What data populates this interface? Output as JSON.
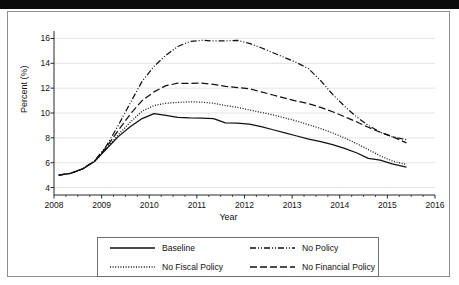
{
  "figure": {
    "outer_frame_color": "#8e8e8e",
    "scan_artifact": "black-bar-top"
  },
  "chart_data": {
    "type": "line",
    "title": "",
    "xlabel": "Year",
    "ylabel": "Percent (%)",
    "xlim": [
      2008,
      2016
    ],
    "ylim": [
      3.4,
      16.6
    ],
    "xticks": [
      2008,
      2009,
      2010,
      2011,
      2012,
      2013,
      2014,
      2015,
      2016
    ],
    "xtick_labels": [
      "2008",
      "2009",
      "2010",
      "2011",
      "2012",
      "2013",
      "2014",
      "2015",
      "2016"
    ],
    "yticks": [
      4,
      6,
      8,
      10,
      12,
      14,
      16
    ],
    "ytick_labels": [
      "4",
      "6",
      "8",
      "10",
      "12",
      "14",
      "16"
    ],
    "grid": "horizontal-major",
    "grid_color": "#d9d9d9",
    "legend_position": "below-axes",
    "line_color": "#111111",
    "series": [
      {
        "name": "Baseline",
        "style": "solid",
        "dash": "none",
        "x": [
          2008.1,
          2008.35,
          2008.6,
          2008.85,
          2009.1,
          2009.35,
          2009.6,
          2009.85,
          2010.1,
          2010.35,
          2010.6,
          2010.85,
          2011.1,
          2011.35,
          2011.6,
          2011.85,
          2012.1,
          2012.35,
          2012.6,
          2012.85,
          2013.1,
          2013.35,
          2013.6,
          2013.85,
          2014.1,
          2014.35,
          2014.6,
          2014.85,
          2015.1,
          2015.4
        ],
        "y": [
          5.0,
          5.15,
          5.5,
          6.1,
          7.1,
          8.1,
          8.9,
          9.55,
          9.95,
          9.8,
          9.65,
          9.6,
          9.58,
          9.55,
          9.2,
          9.18,
          9.1,
          8.9,
          8.65,
          8.4,
          8.15,
          7.9,
          7.7,
          7.45,
          7.15,
          6.8,
          6.35,
          6.2,
          5.9,
          5.65
        ]
      },
      {
        "name": "No Fiscal Policy",
        "style": "dotted",
        "dash": "1,1.6",
        "x": [
          2008.1,
          2008.35,
          2008.6,
          2008.85,
          2009.1,
          2009.35,
          2009.6,
          2009.85,
          2010.1,
          2010.35,
          2010.6,
          2010.85,
          2011.1,
          2011.35,
          2011.6,
          2011.85,
          2012.1,
          2012.35,
          2012.6,
          2012.85,
          2013.1,
          2013.35,
          2013.6,
          2013.85,
          2014.1,
          2014.35,
          2014.6,
          2014.85,
          2015.1,
          2015.4
        ],
        "y": [
          5.0,
          5.15,
          5.5,
          6.1,
          7.15,
          8.25,
          9.25,
          10.15,
          10.6,
          10.78,
          10.85,
          10.9,
          10.88,
          10.78,
          10.6,
          10.45,
          10.25,
          10.05,
          9.85,
          9.6,
          9.35,
          9.05,
          8.75,
          8.4,
          8.0,
          7.55,
          7.05,
          6.55,
          6.15,
          5.85
        ]
      },
      {
        "name": "No Policy",
        "style": "dash-dot-dot",
        "dash": "6,2,1,2,1,2",
        "x": [
          2008.1,
          2008.35,
          2008.6,
          2008.85,
          2009.1,
          2009.35,
          2009.6,
          2009.85,
          2010.1,
          2010.35,
          2010.6,
          2010.85,
          2011.1,
          2011.35,
          2011.6,
          2011.85,
          2012.1,
          2012.35,
          2012.6,
          2012.85,
          2013.1,
          2013.35,
          2013.6,
          2013.85,
          2014.1,
          2014.35,
          2014.6,
          2014.85,
          2015.1,
          2015.4
        ],
        "y": [
          5.0,
          5.15,
          5.5,
          6.15,
          7.35,
          9.0,
          10.8,
          12.55,
          13.75,
          14.65,
          15.35,
          15.75,
          15.85,
          15.8,
          15.8,
          15.85,
          15.6,
          15.25,
          14.85,
          14.45,
          14.05,
          13.55,
          12.6,
          11.5,
          10.55,
          9.7,
          9.0,
          8.45,
          8.1,
          7.85
        ]
      },
      {
        "name": "No Financial Policy",
        "style": "dashed",
        "dash": "7,3",
        "x": [
          2008.1,
          2008.35,
          2008.6,
          2008.85,
          2009.1,
          2009.35,
          2009.6,
          2009.85,
          2010.1,
          2010.35,
          2010.6,
          2010.85,
          2011.1,
          2011.35,
          2011.6,
          2011.85,
          2012.1,
          2012.35,
          2012.6,
          2012.85,
          2013.1,
          2013.35,
          2013.6,
          2013.85,
          2014.1,
          2014.35,
          2014.6,
          2014.85,
          2015.1,
          2015.4
        ],
        "y": [
          5.0,
          5.15,
          5.5,
          6.12,
          7.25,
          8.6,
          9.9,
          11.0,
          11.7,
          12.2,
          12.4,
          12.38,
          12.4,
          12.3,
          12.15,
          12.05,
          11.95,
          11.7,
          11.45,
          11.2,
          10.95,
          10.75,
          10.45,
          10.1,
          9.7,
          9.3,
          8.85,
          8.45,
          8.1,
          7.6
        ]
      }
    ]
  },
  "legend": {
    "items": [
      {
        "label": "Baseline",
        "style": "solid"
      },
      {
        "label": "No Policy",
        "style": "dash-dot-dot"
      },
      {
        "label": "No Fiscal Policy",
        "style": "dotted"
      },
      {
        "label": "No Financial Policy",
        "style": "dashed"
      }
    ]
  }
}
